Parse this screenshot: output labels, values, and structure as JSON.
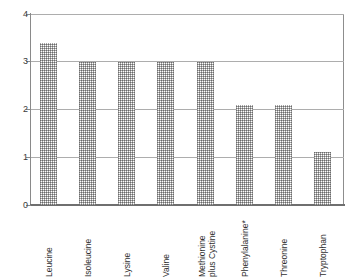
{
  "chart_data": {
    "type": "bar",
    "title": "",
    "subtitle": "",
    "xlabel": "",
    "ylabel": "",
    "ylim": [
      0,
      4
    ],
    "grid": true,
    "legend": false,
    "y_ticks": [
      "0",
      "1",
      "2",
      "3",
      "4"
    ],
    "y_tick_values": [
      0,
      1,
      2,
      3,
      4
    ],
    "categories": [
      "Leucine",
      "Isoleucine",
      "Lysine",
      "Valine",
      "Methionine plus Cystine",
      "Phenylalanine*",
      "Threonine",
      "Tryptophan"
    ],
    "category_lines": [
      [
        "Leucine"
      ],
      [
        "Isoleucine"
      ],
      [
        "Lysine"
      ],
      [
        "Valine"
      ],
      [
        "Methionine",
        "plus Cystine"
      ],
      [
        "Phenylalanine*"
      ],
      [
        "Threonine"
      ],
      [
        "Tryptophan"
      ]
    ],
    "values": [
      3.4,
      3.0,
      3.0,
      3.0,
      3.0,
      2.1,
      2.1,
      1.1
    ],
    "bar_fill": "hatched-gray",
    "colors": {
      "bar": "#c9c9c9",
      "gridline": "#adadad",
      "axis": "#8a8a8a",
      "text": "#2f2f2f"
    }
  },
  "axis_labels": {
    "y0": "0",
    "y1": "1",
    "y2": "2",
    "y3": "3",
    "y4": "4"
  }
}
